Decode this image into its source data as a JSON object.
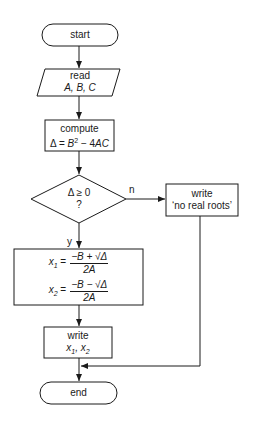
{
  "nodes": {
    "start": {
      "label": "start"
    },
    "read": {
      "line1": "read",
      "line2": "A, B, C"
    },
    "compute": {
      "line1": "compute",
      "line2_prefix": "Δ = ",
      "line2_b": "B",
      "line2_exp": "2",
      "line2_rest": " − 4",
      "line2_ac": "AC"
    },
    "decision": {
      "line1": "Δ ≥ 0",
      "line2": "?"
    },
    "no_roots": {
      "line1": "write",
      "line2": "‘no real roots’"
    },
    "formulas": {
      "x1_lhs": "x",
      "x1_sub": "1",
      "x1_eq": " =",
      "x1_num": "−B + √Δ",
      "x1_den": "2A",
      "x2_lhs": "x",
      "x2_sub": "2",
      "x2_eq": " =",
      "x2_num": "−B − √Δ",
      "x2_den": "2A"
    },
    "write_roots": {
      "line1": "write",
      "x": "x",
      "sub1": "1",
      "sep": ", ",
      "sub2": "2"
    },
    "end": {
      "label": "end"
    }
  },
  "edges": {
    "no_label": "n",
    "yes_label": "y"
  },
  "colors": {
    "stroke": "#1a1a1a",
    "background": "#ffffff"
  }
}
